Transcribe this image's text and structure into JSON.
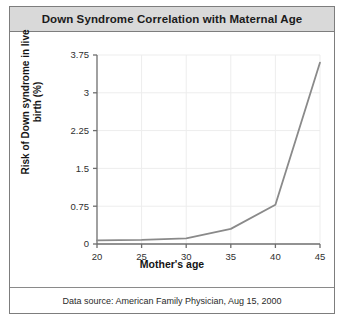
{
  "card": {
    "title": "Down Syndrome Correlation with Maternal Age",
    "footer": "Data source: American Family Physician, Aug 15, 2000"
  },
  "colors": {
    "title_bar": "#d9d9d9",
    "card_border": "#7d7d7d",
    "line": "#8a8a8a",
    "axis": "#6e6e6e",
    "grid": "#ededed",
    "text": "#1b1b1b"
  },
  "chart_data": {
    "type": "line",
    "title": "Down Syndrome Correlation with Maternal Age",
    "xlabel": "Mother's age",
    "ylabel": "Risk of Down syndrome in live birth (%)",
    "x": [
      20,
      25,
      30,
      35,
      40,
      45
    ],
    "values": [
      0.07,
      0.08,
      0.11,
      0.3,
      0.78,
      3.6
    ],
    "series": [
      {
        "name": "Risk of Down syndrome in live birth (%)",
        "values": [
          0.07,
          0.08,
          0.11,
          0.3,
          0.78,
          3.6
        ]
      }
    ],
    "xticks": [
      20,
      25,
      30,
      35,
      40,
      45
    ],
    "xticklabels": [
      "20",
      "25",
      "30",
      "35",
      "40",
      "45"
    ],
    "yticks": [
      0,
      0.75,
      1.5,
      2.25,
      3,
      3.75
    ],
    "yticklabels": [
      "0",
      "0.75",
      "1.5",
      "2.25",
      "3",
      "3.75"
    ],
    "xlim": [
      20,
      45
    ],
    "ylim": [
      0,
      3.75
    ],
    "grid": true,
    "legend": false,
    "markers": false
  }
}
